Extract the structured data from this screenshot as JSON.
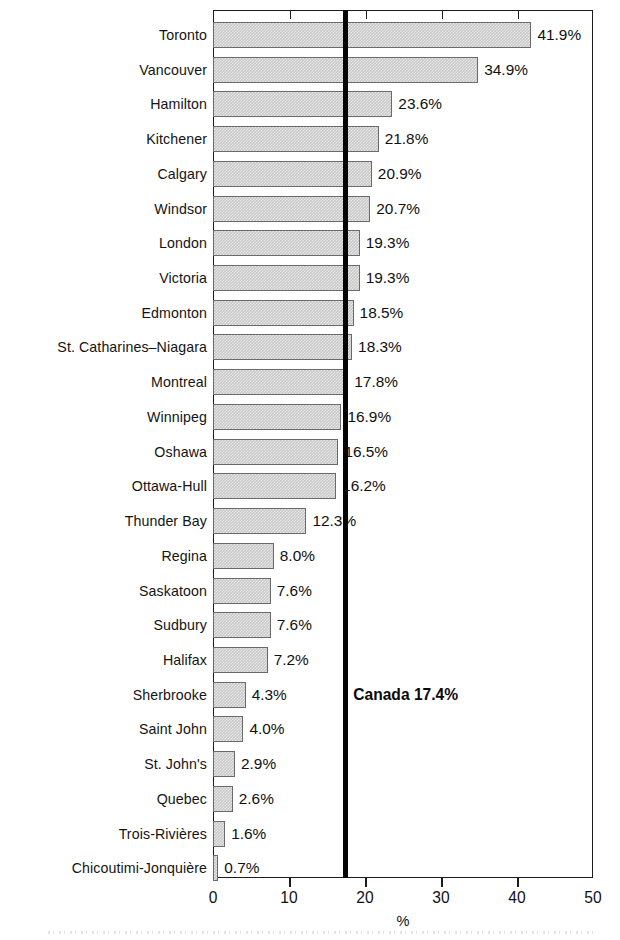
{
  "chart_data": {
    "type": "bar",
    "orientation": "horizontal",
    "title": "",
    "xlabel": "%",
    "ylabel": "",
    "xlim": [
      0,
      50
    ],
    "xticks": [
      0,
      10,
      20,
      30,
      40,
      50
    ],
    "grid": false,
    "legend": null,
    "categories": [
      "Toronto",
      "Vancouver",
      "Hamilton",
      "Kitchener",
      "Calgary",
      "Windsor",
      "London",
      "Victoria",
      "Edmonton",
      "St. Catharines–Niagara",
      "Montreal",
      "Winnipeg",
      "Oshawa",
      "Ottawa-Hull",
      "Thunder Bay",
      "Regina",
      "Saskatoon",
      "Sudbury",
      "Halifax",
      "Sherbrooke",
      "Saint John",
      "St. John's",
      "Quebec",
      "Trois-Rivières",
      "Chicoutimi-Jonquière"
    ],
    "values": [
      41.9,
      34.9,
      23.6,
      21.8,
      20.9,
      20.7,
      19.3,
      19.3,
      18.5,
      18.3,
      17.8,
      16.9,
      16.5,
      16.2,
      12.3,
      8.0,
      7.6,
      7.6,
      7.2,
      4.3,
      4.0,
      2.9,
      2.6,
      1.6,
      0.7
    ],
    "value_labels": [
      "41.9%",
      "34.9%",
      "23.6%",
      "21.8%",
      "20.9%",
      "20.7%",
      "19.3%",
      "19.3%",
      "18.5%",
      "18.3%",
      "17.8%",
      "16.9%",
      "16.5%",
      "16.2%",
      "12.3%",
      "8.0%",
      "7.6%",
      "7.6%",
      "7.2%",
      "4.3%",
      "4.0%",
      "2.9%",
      "2.6%",
      "1.6%",
      "0.7%"
    ],
    "reference_line": {
      "label": "Canada 17.4%",
      "value": 17.4,
      "color": "#050505"
    },
    "colors": {
      "bar_fill": "#c9c9c9",
      "bar_border": "#6a6a6a",
      "axis": "#1c1c1c",
      "text": "#101010"
    }
  }
}
